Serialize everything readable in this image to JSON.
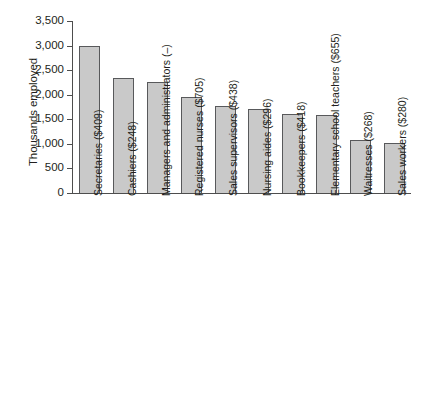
{
  "chart_data": {
    "type": "bar",
    "title": "",
    "xlabel": "",
    "ylabel": "Thousands employed",
    "ylim": [
      0,
      3500
    ],
    "grid": false,
    "legend": null,
    "ytick_labels": [
      "3,500",
      "3,000",
      "2,500",
      "2,000",
      "1,500",
      "1,000",
      "500",
      "0"
    ],
    "ytick_values": [
      3500,
      3000,
      2500,
      2000,
      1500,
      1000,
      500,
      0
    ],
    "categories": [
      "Secretaries ($409)",
      "Cashiers ($248)",
      "Managers and administrators (–)",
      "Registered nurses ($705)",
      "Sales supervisors ($438)",
      "Nursing aides ($296)",
      "Bookkeepers ($418)",
      "Elementary school teachers ($655)",
      "Waitresses ($268)",
      "Sales workers ($280)"
    ],
    "values": [
      3000,
      2350,
      2250,
      1950,
      1780,
      1700,
      1610,
      1580,
      1070,
      1020
    ],
    "bar_color": "#c9c9c9",
    "bar_edge_color": "#58595b",
    "axis_color": "#4d4d4d"
  },
  "caption": {
    "text": ""
  }
}
